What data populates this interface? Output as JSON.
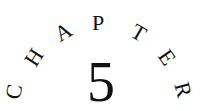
{
  "heading": {
    "word": "CHAPTER",
    "letters": [
      {
        "char": "C",
        "x": 15,
        "y": 92,
        "rotate": -80
      },
      {
        "char": "H",
        "x": 35,
        "y": 58,
        "rotate": -57
      },
      {
        "char": "A",
        "x": 64,
        "y": 33,
        "rotate": -30
      },
      {
        "char": "P",
        "x": 98,
        "y": 24,
        "rotate": 0
      },
      {
        "char": "T",
        "x": 138,
        "y": 34,
        "rotate": 30
      },
      {
        "char": "E",
        "x": 166,
        "y": 58,
        "rotate": 55
      },
      {
        "char": "R",
        "x": 182,
        "y": 90,
        "rotate": 75
      }
    ],
    "number": "5"
  },
  "colors": {
    "text": "#111111",
    "background": "#ffffff"
  }
}
